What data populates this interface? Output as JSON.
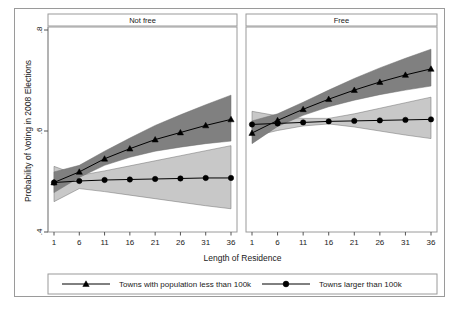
{
  "figure": {
    "title": "",
    "background": "#ffffff",
    "frame_color": "#9a9a9a"
  },
  "axes": {
    "y_title": "Probability of Voting in 2008 Elections",
    "x_title": "Length of Residence",
    "y_ticks": [
      ".4",
      ".6",
      ".8"
    ],
    "x_ticks": [
      "1",
      "6",
      "11",
      "16",
      "21",
      "26",
      "31",
      "36"
    ]
  },
  "panels": [
    {
      "label": "Not free"
    },
    {
      "label": "Free"
    }
  ],
  "legend": {
    "entries": [
      {
        "label": "Towns with population less than 100k",
        "marker": "triangle-marker"
      },
      {
        "label": "Towns larger than 100k",
        "marker": "circle-marker"
      }
    ]
  },
  "colors": {
    "band_dark": "#808080",
    "band_light": "#c8c8c8",
    "line": "#000000",
    "frame": "#9a9a9a"
  },
  "chart_data": {
    "type": "line",
    "xlabel": "Length of Residence",
    "ylabel": "Probability of Voting in 2008 Elections",
    "xlim": [
      1,
      36
    ],
    "ylim": [
      0.4,
      0.8
    ],
    "grid": false,
    "legend_position": "bottom",
    "x": [
      1,
      6,
      11,
      16,
      21,
      26,
      31,
      36
    ],
    "panels": [
      {
        "name": "Not free",
        "series": [
          {
            "name": "Towns with population less than 100k",
            "marker": "triangle",
            "band_color": "#808080",
            "values": [
              0.498,
              0.519,
              0.545,
              0.565,
              0.583,
              0.597,
              0.611,
              0.623
            ],
            "ci_lower": [
              0.478,
              0.508,
              0.532,
              0.548,
              0.56,
              0.568,
              0.575,
              0.58
            ],
            "ci_upper": [
              0.519,
              0.532,
              0.56,
              0.586,
              0.611,
              0.632,
              0.652,
              0.671
            ]
          },
          {
            "name": "Towns larger than 100k",
            "marker": "circle",
            "band_color": "#c8c8c8",
            "values": [
              0.498,
              0.501,
              0.503,
              0.504,
              0.505,
              0.506,
              0.507,
              0.507
            ],
            "ci_lower": [
              0.46,
              0.486,
              0.48,
              0.473,
              0.466,
              0.459,
              0.452,
              0.446
            ],
            "ci_upper": [
              0.53,
              0.512,
              0.521,
              0.531,
              0.541,
              0.551,
              0.561,
              0.571
            ]
          }
        ]
      },
      {
        "name": "Free",
        "series": [
          {
            "name": "Towns with population less than 100k",
            "marker": "triangle",
            "band_color": "#808080",
            "values": [
              0.596,
              0.621,
              0.643,
              0.663,
              0.681,
              0.697,
              0.711,
              0.723
            ],
            "ci_lower": [
              0.575,
              0.609,
              0.631,
              0.648,
              0.661,
              0.672,
              0.681,
              0.689
            ],
            "ci_upper": [
              0.62,
              0.634,
              0.657,
              0.681,
              0.704,
              0.725,
              0.744,
              0.762
            ]
          },
          {
            "name": "Towns larger than 100k",
            "marker": "circle",
            "band_color": "#c8c8c8",
            "values": [
              0.613,
              0.615,
              0.617,
              0.619,
              0.62,
              0.621,
              0.622,
              0.623
            ],
            "ci_lower": [
              0.589,
              0.601,
              0.61,
              0.614,
              0.608,
              0.6,
              0.592,
              0.585
            ],
            "ci_upper": [
              0.639,
              0.63,
              0.625,
              0.625,
              0.634,
              0.645,
              0.656,
              0.667
            ]
          }
        ]
      }
    ]
  }
}
